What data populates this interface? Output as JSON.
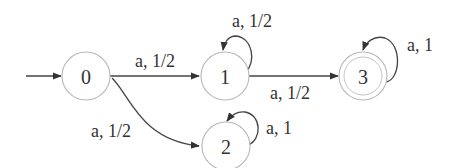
{
  "diagram": {
    "type": "probabilistic-automaton",
    "initial_state": "0",
    "accepting_states": [
      "3"
    ],
    "states": [
      {
        "id": "0",
        "label": "0"
      },
      {
        "id": "1",
        "label": "1"
      },
      {
        "id": "2",
        "label": "2"
      },
      {
        "id": "3",
        "label": "3"
      }
    ],
    "transitions": [
      {
        "from": "0",
        "to": "1",
        "label": "a, 1/2"
      },
      {
        "from": "0",
        "to": "2",
        "label": "a, 1/2"
      },
      {
        "from": "1",
        "to": "1",
        "label": "a, 1/2"
      },
      {
        "from": "1",
        "to": "3",
        "label": "a, 1/2"
      },
      {
        "from": "2",
        "to": "2",
        "label": "a, 1"
      },
      {
        "from": "3",
        "to": "3",
        "label": "a, 1"
      }
    ]
  },
  "colors": {
    "background": "#ffffff",
    "state_stroke": "#b8b8b8",
    "edge": "#444444",
    "text": "#333333"
  }
}
